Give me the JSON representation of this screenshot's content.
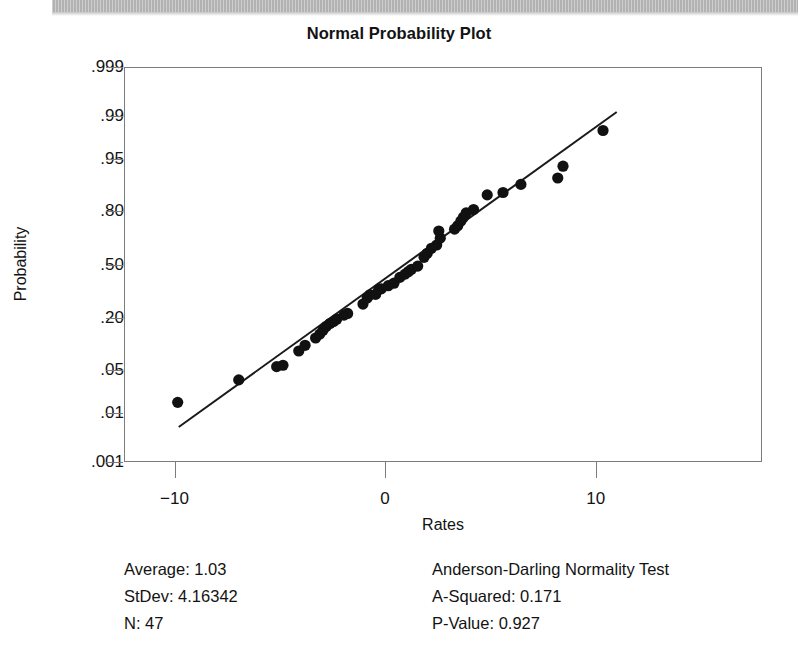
{
  "page": {
    "header_strip": "scanned-page-header-band"
  },
  "chart_data": {
    "type": "scatter",
    "title": "Normal Probability Plot",
    "xlabel": "Rates",
    "ylabel": "Probability",
    "xlim": [
      -12.4,
      17.9
    ],
    "ylim_probability": [
      0.001,
      0.999
    ],
    "grid": false,
    "legend": null,
    "x_ticks": [
      {
        "label": "−10",
        "value": -10
      },
      {
        "label": "0",
        "value": 0
      },
      {
        "label": "10",
        "value": 10
      }
    ],
    "y_ticks": [
      {
        "label": ".999",
        "value": 0.999
      },
      {
        "label": ".99",
        "value": 0.99
      },
      {
        "label": ".95",
        "value": 0.95
      },
      {
        "label": ".80",
        "value": 0.8
      },
      {
        "label": ".50",
        "value": 0.5
      },
      {
        "label": ".20",
        "value": 0.2
      },
      {
        "label": ".05",
        "value": 0.05
      },
      {
        "label": ".01",
        "value": 0.01
      },
      {
        "label": ".001",
        "value": 0.001
      }
    ],
    "fit_line": {
      "description": "normal distribution reference line",
      "x_start": -9.8,
      "x_end": 11.0,
      "p_start": 0.0055,
      "p_end": 0.9915
    },
    "points": [
      {
        "x": -9.85,
        "p": 0.0155
      },
      {
        "x": -6.95,
        "p": 0.0355
      },
      {
        "x": -5.15,
        "p": 0.055
      },
      {
        "x": -4.85,
        "p": 0.0575
      },
      {
        "x": -4.1,
        "p": 0.088
      },
      {
        "x": -3.8,
        "p": 0.103
      },
      {
        "x": -3.3,
        "p": 0.125
      },
      {
        "x": -3.1,
        "p": 0.138
      },
      {
        "x": -2.95,
        "p": 0.152
      },
      {
        "x": -2.8,
        "p": 0.166
      },
      {
        "x": -2.62,
        "p": 0.178
      },
      {
        "x": -2.45,
        "p": 0.186
      },
      {
        "x": -2.3,
        "p": 0.196
      },
      {
        "x": -1.95,
        "p": 0.214
      },
      {
        "x": -1.78,
        "p": 0.222
      },
      {
        "x": -1.05,
        "p": 0.268
      },
      {
        "x": -0.85,
        "p": 0.3
      },
      {
        "x": -0.72,
        "p": 0.318
      },
      {
        "x": -0.45,
        "p": 0.32
      },
      {
        "x": -0.3,
        "p": 0.35
      },
      {
        "x": -0.18,
        "p": 0.352
      },
      {
        "x": 0.15,
        "p": 0.37
      },
      {
        "x": 0.42,
        "p": 0.385
      },
      {
        "x": 0.7,
        "p": 0.42
      },
      {
        "x": 0.95,
        "p": 0.44
      },
      {
        "x": 1.1,
        "p": 0.455
      },
      {
        "x": 1.25,
        "p": 0.47
      },
      {
        "x": 1.55,
        "p": 0.49
      },
      {
        "x": 1.85,
        "p": 0.545
      },
      {
        "x": 2.0,
        "p": 0.57
      },
      {
        "x": 2.2,
        "p": 0.6
      },
      {
        "x": 2.45,
        "p": 0.62
      },
      {
        "x": 2.62,
        "p": 0.66
      },
      {
        "x": 2.55,
        "p": 0.7
      },
      {
        "x": 3.3,
        "p": 0.71
      },
      {
        "x": 3.45,
        "p": 0.728
      },
      {
        "x": 3.6,
        "p": 0.752
      },
      {
        "x": 3.72,
        "p": 0.77
      },
      {
        "x": 3.85,
        "p": 0.79
      },
      {
        "x": 4.2,
        "p": 0.805
      },
      {
        "x": 4.85,
        "p": 0.862
      },
      {
        "x": 5.6,
        "p": 0.87
      },
      {
        "x": 6.45,
        "p": 0.895
      },
      {
        "x": 8.2,
        "p": 0.912
      },
      {
        "x": 8.45,
        "p": 0.938
      },
      {
        "x": 10.35,
        "p": 0.982
      }
    ],
    "point_color": "#111111",
    "line_color": "#1a1a1a"
  },
  "stats": {
    "left": {
      "average": "Average:  1.03",
      "stdev": "StDev:  4.16342",
      "n": "N:  47"
    },
    "right": {
      "test_name": "Anderson-Darling Normality Test",
      "a_squared": "A-Squared:  0.171",
      "p_value": "P-Value:   0.927"
    }
  }
}
